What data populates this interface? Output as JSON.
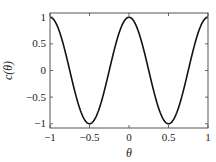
{
  "chart_data": {
    "type": "line",
    "title": "",
    "xlabel": "θ",
    "ylabel": "c(θ)",
    "function": "cos(2πθ)",
    "xlim": [
      -1,
      1
    ],
    "ylim": [
      -1.08,
      1.08
    ],
    "x_ticks": [
      -1,
      -0.5,
      0,
      0.5,
      1
    ],
    "x_tick_labels": [
      "−1",
      "−0.5",
      "0",
      "0.5",
      "1"
    ],
    "y_ticks": [
      1,
      0.5,
      0,
      -0.5,
      -1
    ],
    "y_tick_labels": [
      "1",
      "0.5",
      "0",
      "−0.5",
      "−1"
    ],
    "grid": false,
    "legend": null,
    "series": [
      {
        "name": "c(θ)",
        "color": "#111111",
        "x": [
          -1,
          -0.9,
          -0.8,
          -0.75,
          -0.7,
          -0.6,
          -0.5,
          -0.4,
          -0.3,
          -0.25,
          -0.2,
          -0.1,
          0,
          0.1,
          0.2,
          0.25,
          0.3,
          0.4,
          0.5,
          0.6,
          0.7,
          0.75,
          0.8,
          0.9,
          1
        ],
        "values": [
          1,
          0.809,
          0.309,
          0,
          -0.309,
          -0.809,
          -1,
          -0.809,
          -0.309,
          0,
          0.309,
          0.809,
          1,
          0.809,
          0.309,
          0,
          -0.309,
          -0.809,
          -1,
          -0.809,
          -0.309,
          0,
          0.309,
          0.809,
          1
        ]
      }
    ]
  },
  "plot_area": {
    "left": 50,
    "top": 13,
    "right": 208,
    "bottom": 128
  }
}
